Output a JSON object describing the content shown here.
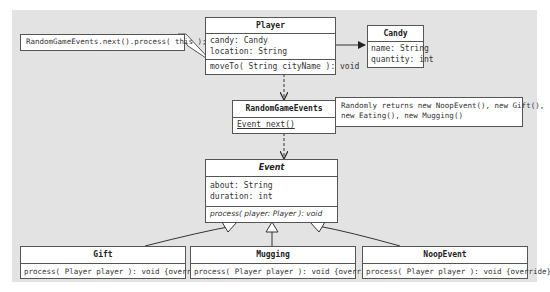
{
  "diagram": {
    "type": "UML class diagram",
    "classes": {
      "player": {
        "name": "Player",
        "attributes": [
          "candy: Candy",
          "location: String"
        ],
        "methods": [
          "moveTo( String cityName ): void"
        ]
      },
      "candy": {
        "name": "Candy",
        "attributes": [
          "name: String",
          "quantity: int"
        ]
      },
      "random_game_events": {
        "name": "RandomGameEvents",
        "methods": [
          "Event next()"
        ]
      },
      "event": {
        "name": "Event",
        "attributes": [
          "about: String",
          "duration: int"
        ],
        "methods": [
          "process( player: Player ): void"
        ]
      },
      "gift": {
        "name": "Gift",
        "methods": [
          "process( Player player ): void {override}"
        ]
      },
      "mugging": {
        "name": "Mugging",
        "methods": [
          "process( Player player ): void {override}"
        ]
      },
      "noop_event": {
        "name": "NoopEvent",
        "methods": [
          "process( Player player ): void {override}"
        ]
      }
    },
    "notes": {
      "move_to_note": "RandomGameEvents.next().process( this );",
      "next_note_line1": "Randomly returns new NoopEvent(), new Gift(),",
      "next_note_line2": "new Eating(), new Mugging()"
    },
    "relationships": [
      {
        "from": "Player",
        "to": "Candy",
        "kind": "association"
      },
      {
        "from": "Player",
        "to": "RandomGameEvents",
        "kind": "dependency"
      },
      {
        "from": "RandomGameEvents",
        "to": "Event",
        "kind": "dependency"
      },
      {
        "from": "Gift",
        "to": "Event",
        "kind": "generalization"
      },
      {
        "from": "Mugging",
        "to": "Event",
        "kind": "generalization"
      },
      {
        "from": "NoopEvent",
        "to": "Event",
        "kind": "generalization"
      }
    ],
    "colors": {
      "background": "#e3e3e3",
      "box_fill": "#ffffff",
      "stroke": "#555555"
    }
  }
}
